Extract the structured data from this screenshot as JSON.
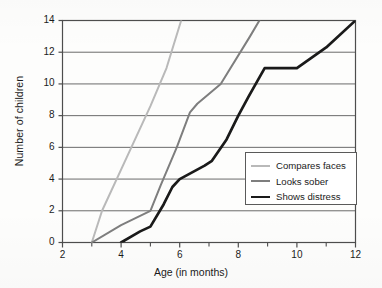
{
  "chart_data": {
    "type": "line",
    "title": "",
    "xlabel": "Age (in months)",
    "ylabel": "Number of children",
    "xlim": [
      2,
      12
    ],
    "ylim": [
      0,
      14
    ],
    "xticks": [
      2,
      4,
      6,
      8,
      10,
      12
    ],
    "yticks": [
      0,
      2,
      4,
      6,
      8,
      10,
      12,
      14
    ],
    "xtick_labels": [
      "2",
      "4",
      "6",
      "8",
      "10",
      "12"
    ],
    "ytick_labels": [
      "0",
      "2",
      "4",
      "6",
      "8",
      "10",
      "12",
      "14"
    ],
    "xminor_ticks": [
      3,
      5,
      7,
      9,
      11
    ],
    "grid": "horizontal",
    "legend_position": "center-right",
    "series": [
      {
        "name": "Compares faces",
        "color": "#b9b9b9",
        "width": 2.0,
        "points": [
          [
            3,
            0
          ],
          [
            3.35,
            2
          ],
          [
            4.35,
            6
          ],
          [
            5.0,
            8.6
          ],
          [
            5.55,
            11
          ],
          [
            6.05,
            14
          ]
        ]
      },
      {
        "name": "Looks sober",
        "color": "#7e7e7e",
        "width": 2.0,
        "points": [
          [
            3,
            0
          ],
          [
            4.0,
            1.1
          ],
          [
            5.0,
            2.0
          ],
          [
            5.35,
            3.6
          ],
          [
            5.9,
            6.0
          ],
          [
            6.35,
            8.2
          ],
          [
            6.6,
            8.75
          ],
          [
            7.4,
            10.0
          ],
          [
            8.4,
            13.0
          ],
          [
            8.72,
            14
          ]
        ]
      },
      {
        "name": "Shows distress",
        "color": "#1a1a1a",
        "width": 2.7,
        "points": [
          [
            4,
            0
          ],
          [
            4.65,
            0.7
          ],
          [
            5.0,
            1.0
          ],
          [
            5.45,
            2.4
          ],
          [
            5.75,
            3.5
          ],
          [
            6.0,
            4.0
          ],
          [
            6.85,
            4.85
          ],
          [
            7.1,
            5.15
          ],
          [
            7.6,
            6.5
          ],
          [
            8.0,
            8.0
          ],
          [
            8.35,
            9.2
          ],
          [
            8.9,
            11.0
          ],
          [
            10.0,
            11.0
          ],
          [
            11.0,
            12.3
          ],
          [
            12.0,
            14.0
          ]
        ]
      }
    ]
  },
  "legend": {
    "items": [
      {
        "label": "Compares faces",
        "color": "#b9b9b9",
        "width": 2.0
      },
      {
        "label": "Looks sober",
        "color": "#7e7e7e",
        "width": 2.0
      },
      {
        "label": "Shows distress",
        "color": "#1a1a1a",
        "width": 2.7
      }
    ]
  },
  "style": {
    "axis_color": "#4d4d4d",
    "grid_color": "#6b6b6b",
    "text_color": "#1b1b1b",
    "background": "#fdfdfc"
  }
}
